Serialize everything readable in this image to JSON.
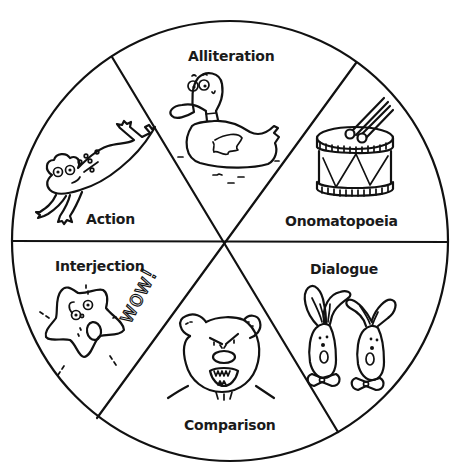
{
  "diagram": {
    "type": "wheel",
    "segments": 6,
    "colors": {
      "line": "#111111",
      "background": "#ffffff",
      "text": "#1a1a1a"
    },
    "sections": [
      {
        "position": "top",
        "label": "Alliteration",
        "illustration": "duck"
      },
      {
        "position": "upper-right",
        "label": "Onomatopoeia",
        "illustration": "drum"
      },
      {
        "position": "lower-right",
        "label": "Dialogue",
        "illustration": "two-rabbits"
      },
      {
        "position": "bottom",
        "label": "Comparison",
        "illustration": "bear"
      },
      {
        "position": "lower-left",
        "label": "Interjection",
        "illustration": "star",
        "exclamation": "wow!"
      },
      {
        "position": "upper-left",
        "label": "Action",
        "illustration": "leaping-frog"
      }
    ]
  }
}
